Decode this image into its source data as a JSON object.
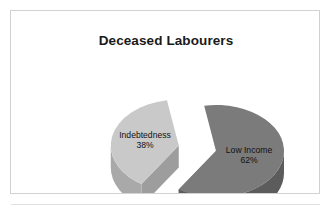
{
  "figure": {
    "frame_border_color": "#d2d2d2",
    "background_color": "#ffffff",
    "rule_color": "#e0e0e0"
  },
  "chart_data": {
    "type": "pie",
    "title": "Deceased Labourers",
    "subtitle": "",
    "xlabel": "",
    "ylabel": "",
    "exploded": true,
    "three_d": true,
    "legend": "none",
    "grid": false,
    "value_unit": "%",
    "categories": [
      "Low Income",
      "Indebtedness"
    ],
    "values": [
      62,
      38
    ],
    "labels": [
      "Low Income\n62%",
      "Indebtedness\n38%"
    ],
    "slices": [
      {
        "name": "Low Income",
        "value": 62,
        "value_label": "62%",
        "top_color": "#7b7b7b",
        "side_color": "#5c5c5c",
        "exploded": false
      },
      {
        "name": "Indebtedness",
        "value": 38,
        "value_label": "38%",
        "top_color": "#c9c9c9",
        "side_color": "#a9a9a9",
        "exploded": true
      }
    ]
  },
  "title": {
    "text": "Deceased Labourers"
  },
  "slice_labels": {
    "indebtedness": {
      "name": "Indebtedness",
      "pct": "38%"
    },
    "low_income": {
      "name": "Low Income",
      "pct": "62%"
    }
  }
}
